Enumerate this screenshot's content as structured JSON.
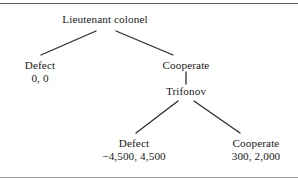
{
  "figure": {
    "type": "extensive-form-game-tree",
    "line_color": "#2b2b2b",
    "text_color": "#1a1a1a",
    "rule_color": "#5a5a5a"
  },
  "nodes": {
    "root": {
      "label": "Lieutenant colonel",
      "payoff": ""
    },
    "left_defect": {
      "label": "Defect",
      "payoff": "0, 0"
    },
    "left_cooperate": {
      "label": "Cooperate",
      "payoff": ""
    },
    "trifonov": {
      "label": "Trifonov",
      "payoff": ""
    },
    "bottom_defect": {
      "label": "Defect",
      "payoff": "−4,500, 4,500"
    },
    "bottom_cooperate": {
      "label": "Cooperate",
      "payoff": "300, 2,000"
    }
  }
}
